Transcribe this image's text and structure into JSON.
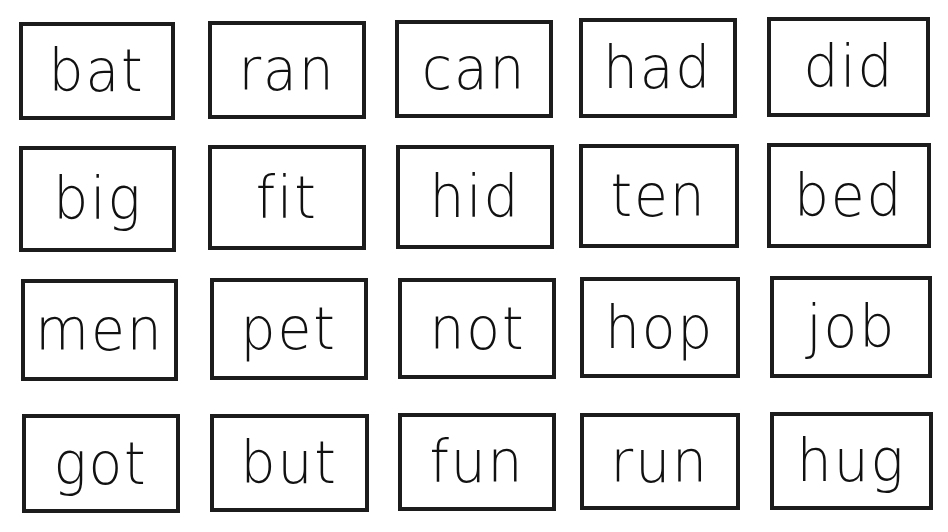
{
  "worksheet": {
    "rows": [
      [
        "bat",
        "ran",
        "can",
        "had",
        "did"
      ],
      [
        "big",
        "fit",
        "hid",
        "ten",
        "bed"
      ],
      [
        "men",
        "pet",
        "not",
        "hop",
        "job"
      ],
      [
        "got",
        "but",
        "fun",
        "run",
        "hug"
      ]
    ]
  },
  "colors": {
    "border": "#1c1c1c",
    "text": "#111111",
    "background": "#ffffff"
  }
}
